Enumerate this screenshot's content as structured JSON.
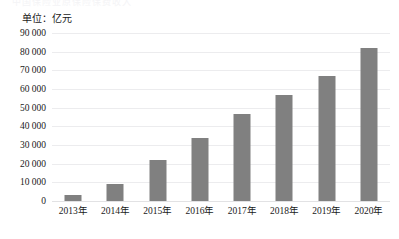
{
  "figure": {
    "clipped_top_text": "中国保险业原保险保费收入",
    "unit_label": "单位：亿元"
  },
  "colors": {
    "bar": "#808080",
    "gridline": "#ececee",
    "text": "#1a1a1a",
    "background": "#ffffff"
  },
  "chart_data": {
    "type": "bar",
    "title": "",
    "subtitle": "",
    "xlabel": "",
    "ylabel": "单位：亿元",
    "categories": [
      "2013年",
      "2014年",
      "2015年",
      "2016年",
      "2017年",
      "2018年",
      "2019年",
      "2020年"
    ],
    "values": [
      3000,
      9000,
      22000,
      34000,
      46500,
      57000,
      67000,
      82000
    ],
    "ylim": [
      0,
      90000
    ],
    "ytick_step": 10000,
    "ytick_labels": [
      "0",
      "10 000",
      "20 000",
      "30 000",
      "40 000",
      "50 000",
      "60 000",
      "70 000",
      "80 000",
      "90 000"
    ],
    "ytick_values": [
      0,
      10000,
      20000,
      30000,
      40000,
      50000,
      60000,
      70000,
      80000,
      90000
    ],
    "grid": true,
    "grid_axis": "y",
    "legend": false,
    "legend_position": "none",
    "series": [
      {
        "name": "",
        "values": [
          3000,
          9000,
          22000,
          34000,
          46500,
          57000,
          67000,
          82000
        ]
      }
    ]
  }
}
